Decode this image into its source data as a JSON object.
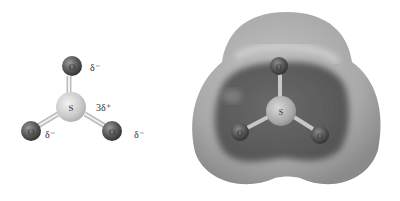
{
  "figure": {
    "left_model": {
      "title": "Ball-and-stick model of SO3 with partial charges",
      "atoms": [
        {
          "id": "O_top",
          "symbol": "O",
          "charge": "δ⁻"
        },
        {
          "id": "S_center",
          "symbol": "S",
          "charge": "3δ⁺"
        },
        {
          "id": "O_left",
          "symbol": "O",
          "charge": "δ⁻"
        },
        {
          "id": "O_right",
          "symbol": "O",
          "charge": "δ⁻"
        }
      ]
    },
    "right_model": {
      "title": "Electrostatic potential surface of SO3",
      "atoms": [
        {
          "id": "O_top",
          "symbol": "O"
        },
        {
          "id": "S_center",
          "symbol": "S"
        },
        {
          "id": "O_left",
          "symbol": "O"
        },
        {
          "id": "O_right",
          "symbol": "O"
        }
      ]
    },
    "colors": {
      "oxygen": "#555555",
      "sulfur": "#cfcfcf",
      "bond": "#e6e6e6",
      "surface_outer": "#a9a9a9",
      "surface_inner": "#5e5e5e"
    }
  }
}
